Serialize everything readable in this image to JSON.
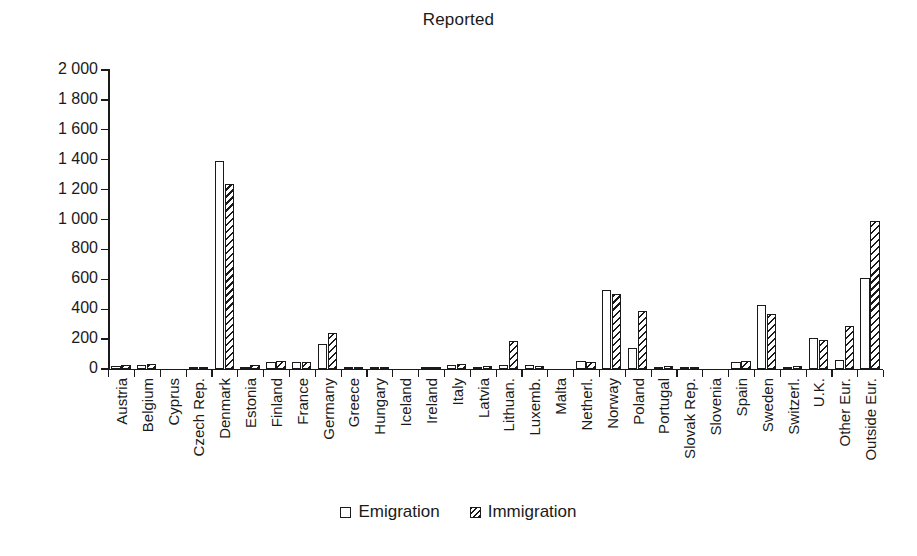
{
  "chart_data": {
    "type": "bar",
    "title": "Reported",
    "xlabel": "",
    "ylabel": "",
    "ylim": [
      0,
      2000
    ],
    "ytick_values": [
      0,
      200,
      400,
      600,
      800,
      1000,
      1200,
      1400,
      1600,
      1800,
      2000
    ],
    "ytick_labels": [
      "0",
      "200",
      "400",
      "600",
      "800",
      "1 000",
      "1 200",
      "1 400",
      "1 600",
      "1 800",
      "2 000"
    ],
    "grid": false,
    "legend_position": "bottom-center",
    "categories": [
      "Austria",
      "Belgium",
      "Cyprus",
      "Czech Rep.",
      "Denmark",
      "Estonia",
      "Finland",
      "France",
      "Germany",
      "Greece",
      "Hungary",
      "Iceland",
      "Ireland",
      "Italy",
      "Latvia",
      "Lithuan.",
      "Luxemb.",
      "Malta",
      "Netherl.",
      "Norway",
      "Poland",
      "Portugal",
      "Slovak Rep.",
      "Slovenia",
      "Spain",
      "Sweden",
      "Switzerl.",
      "U.K.",
      "Other Eur.",
      "Outside Eur."
    ],
    "series": [
      {
        "name": "Emigration",
        "fill": "white",
        "values": [
          20,
          25,
          0,
          15,
          1390,
          15,
          50,
          50,
          165,
          5,
          10,
          0,
          5,
          25,
          15,
          30,
          25,
          0,
          55,
          530,
          140,
          15,
          5,
          0,
          50,
          430,
          15,
          210,
          60,
          610
        ]
      },
      {
        "name": "Immigration",
        "fill": "hatched",
        "values": [
          25,
          35,
          0,
          10,
          1240,
          25,
          55,
          45,
          240,
          10,
          10,
          0,
          5,
          35,
          20,
          185,
          20,
          0,
          50,
          500,
          390,
          20,
          5,
          0,
          55,
          370,
          20,
          195,
          290,
          990
        ]
      }
    ]
  },
  "legend": {
    "items": [
      {
        "label": "Emigration",
        "swatch": "white-square-icon"
      },
      {
        "label": "Immigration",
        "swatch": "hatched-square-icon"
      }
    ]
  }
}
